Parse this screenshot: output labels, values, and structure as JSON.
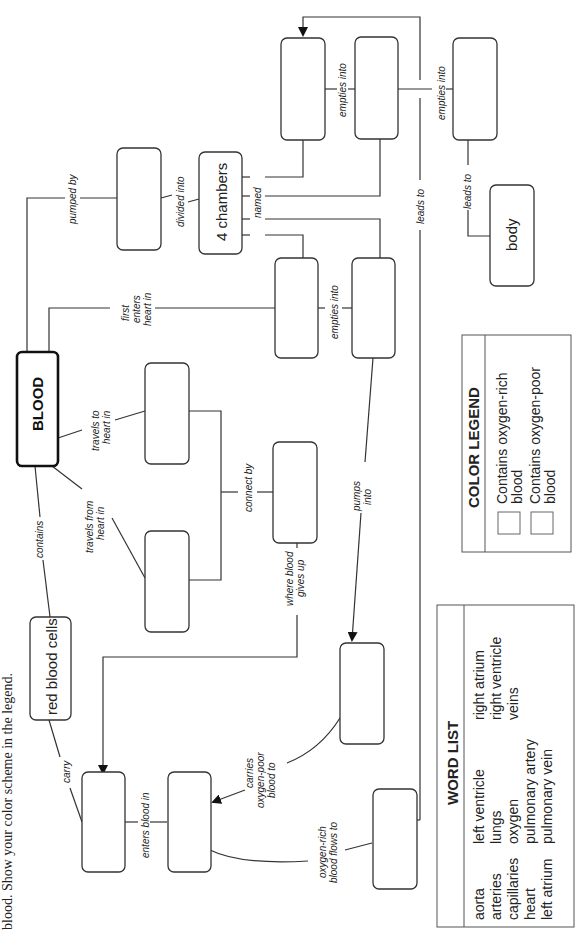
{
  "instruction": "blood. Show your color scheme in the legend.",
  "nodes": {
    "blood": "BLOOD",
    "red_blood_cells": "red blood cells",
    "four_chambers": "4 chambers",
    "body": "body",
    "blank": ""
  },
  "links": {
    "pumped_by": "pumped by",
    "divided_into": "divided into",
    "named": "named",
    "first_enters_1": "first",
    "first_enters_2": "enters",
    "first_enters_3": "heart in",
    "empties_into_a": "empties into",
    "empties_into_b": "empties into",
    "empties_into_c": "empties into",
    "leads_to_a": "leads to",
    "leads_to_b": "leads to",
    "travels_to_1": "travels to",
    "travels_to_2": "heart in",
    "travels_from_1": "travels from",
    "travels_from_2": "heart in",
    "connect_by": "connect by",
    "pumps_into_1": "pumps",
    "pumps_into_2": "into",
    "contains": "contains",
    "where_blood_1": "where blood",
    "where_blood_2": "gives up",
    "carry": "carry",
    "enters_blood_in": "enters blood in",
    "carries_1": "carries",
    "carries_2": "oxygen-poor",
    "carries_3": "blood to",
    "oxygen_rich_1": "oxygen-rich",
    "oxygen_rich_2": "blood flows to"
  },
  "color_legend": {
    "title": "COLOR LEGEND",
    "items": [
      {
        "label_1": "Contains oxygen-rich",
        "label_2": "blood",
        "swatch": "#ffffff"
      },
      {
        "label_1": "Contains oxygen-poor",
        "label_2": "blood",
        "swatch": "#ffffff"
      }
    ]
  },
  "word_list": {
    "title": "WORD LIST",
    "columns": [
      [
        "aorta",
        "arteries",
        "capillaries",
        "heart",
        "left atrium"
      ],
      [
        "left ventricle",
        "lungs",
        "oxygen",
        "pulmonary artery",
        "pulmonary vein"
      ],
      [
        "right atrium",
        "right ventricle",
        "veins"
      ]
    ]
  }
}
